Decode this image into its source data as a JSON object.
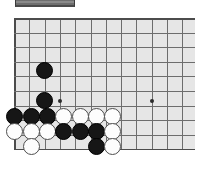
{
  "app": {
    "title": "Go board position",
    "background": "#ffffff"
  },
  "toolbar": {
    "name": "truncated-toolbar",
    "color": "#6e6e6e",
    "x": 15,
    "y": 0,
    "width": 60,
    "height": 7
  },
  "board": {
    "name": "go-board",
    "board_color": "#e6e6e6",
    "line_color": "#6d6d6d",
    "edge_color": "#4c4c4c",
    "x": 14,
    "y": 18,
    "width": 181,
    "height": 132,
    "cell": 15.3,
    "cols": 12,
    "rows": 9,
    "col_xs": [
      14.0,
      29.3,
      44.6,
      59.9,
      75.2,
      90.5,
      105.8,
      121.1,
      136.4,
      151.7,
      167.0,
      182.3,
      195.0
    ],
    "row_ys": [
      18.0,
      32.6,
      47.2,
      61.8,
      76.4,
      91.0,
      105.6,
      120.2,
      134.8,
      149.4
    ],
    "star_points": [
      {
        "name": "star-point-left",
        "x": 59.9,
        "y": 100.5
      },
      {
        "name": "star-point-right",
        "x": 151.7,
        "y": 100.5
      }
    ],
    "stone_diameter": 17,
    "stones": [
      {
        "name": "black-stone",
        "color": "black",
        "x": 44.6,
        "y": 70.0
      },
      {
        "name": "black-stone",
        "color": "black",
        "x": 44.6,
        "y": 100.5
      },
      {
        "name": "black-stone",
        "color": "black",
        "x": 14.5,
        "y": 116.0
      },
      {
        "name": "black-stone",
        "color": "black",
        "x": 31.0,
        "y": 116.0
      },
      {
        "name": "black-stone",
        "color": "black",
        "x": 47.0,
        "y": 116.0
      },
      {
        "name": "white-stone",
        "color": "white",
        "x": 63.5,
        "y": 116.0
      },
      {
        "name": "white-stone",
        "color": "white",
        "x": 80.0,
        "y": 116.0
      },
      {
        "name": "white-stone",
        "color": "white",
        "x": 96.5,
        "y": 116.0
      },
      {
        "name": "white-stone",
        "color": "white",
        "x": 112.5,
        "y": 116.0
      },
      {
        "name": "white-stone",
        "color": "white",
        "x": 14.5,
        "y": 131.5
      },
      {
        "name": "white-stone",
        "color": "white",
        "x": 31.0,
        "y": 131.5
      },
      {
        "name": "white-stone",
        "color": "white",
        "x": 47.0,
        "y": 131.5
      },
      {
        "name": "black-stone",
        "color": "black",
        "x": 63.5,
        "y": 131.5
      },
      {
        "name": "black-stone",
        "color": "black",
        "x": 80.0,
        "y": 131.5
      },
      {
        "name": "black-stone",
        "color": "black",
        "x": 96.5,
        "y": 131.5
      },
      {
        "name": "white-stone",
        "color": "white",
        "x": 112.5,
        "y": 131.5
      },
      {
        "name": "white-stone",
        "color": "white",
        "x": 31.0,
        "y": 146.5
      },
      {
        "name": "black-stone",
        "color": "black",
        "x": 96.5,
        "y": 146.5
      },
      {
        "name": "white-stone",
        "color": "white",
        "x": 112.5,
        "y": 146.5
      }
    ]
  }
}
